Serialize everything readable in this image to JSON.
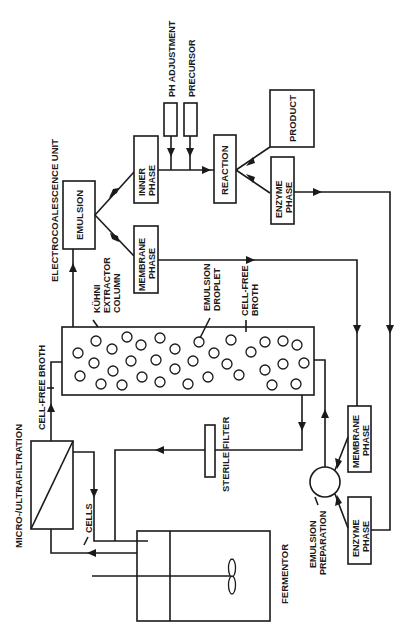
{
  "diagram": {
    "orientation": "rotated-90-ccw",
    "colors": {
      "ink": "#1a1a1a",
      "background": "#ffffff"
    },
    "nodes": {
      "fermentor": {
        "label": "FERMENTOR"
      },
      "filtration": {
        "label": "MICRO-/ULTRAFILTRATION"
      },
      "cells": {
        "label": "CELLS"
      },
      "cell_free_broth_in": {
        "label": "CELL-FREE BROTH"
      },
      "sterile_filter": {
        "label": "STERILE  FILTER"
      },
      "extractor": {
        "line1": "KÜHNI",
        "line2": "EXTRACTOR",
        "line3": "COLUMN"
      },
      "emulsion_droplet": {
        "line1": "EMULSION",
        "line2": "DROPLET"
      },
      "cell_free_broth_out": {
        "line1": "CELL-FREE",
        "line2": "BROTH"
      },
      "electrocoalescence": {
        "label": "ELECTROCOALESCENCE UNIT"
      },
      "emulsion": {
        "label": "EMULSION"
      },
      "inner_phase": {
        "line1": "INNER",
        "line2": "PHASE"
      },
      "membrane_phase_top": {
        "line1": "MEMBRANE",
        "line2": "PHASE"
      },
      "ph_adjustment": {
        "label": "PH ADJUSTMENT"
      },
      "precursor": {
        "label": "PRECURSOR"
      },
      "reaction": {
        "label": "REACTION"
      },
      "product": {
        "label": "PRODUCT"
      },
      "enzyme_phase_top": {
        "line1": "ENZYME",
        "line2": "PHASE"
      },
      "membrane_phase_bottom": {
        "line1": "MEMBRANE",
        "line2": "PHASE"
      },
      "enzyme_phase_bottom": {
        "line1": "ENZYME",
        "line2": "PHASE"
      },
      "emulsion_preparation": {
        "line1": "EMULSION",
        "line2": "PREPARATION"
      }
    },
    "edges": [
      {
        "from": "fermentor",
        "to": "filtration"
      },
      {
        "from": "filtration",
        "to": "fermentor",
        "label": "CELLS"
      },
      {
        "from": "filtration",
        "to": "extractor",
        "label": "CELL-FREE BROTH"
      },
      {
        "from": "extractor",
        "to": "sterile_filter",
        "via": "cell-free broth"
      },
      {
        "from": "sterile_filter",
        "to": "fermentor"
      },
      {
        "from": "extractor",
        "to": "emulsion"
      },
      {
        "from": "emulsion",
        "to": "inner_phase"
      },
      {
        "from": "emulsion",
        "to": "membrane_phase_top"
      },
      {
        "from": "ph_adjustment",
        "to": "reaction_line"
      },
      {
        "from": "precursor",
        "to": "reaction_line"
      },
      {
        "from": "inner_phase",
        "to": "reaction"
      },
      {
        "from": "reaction",
        "to": "product"
      },
      {
        "from": "reaction",
        "to": "enzyme_phase_top"
      },
      {
        "from": "membrane_phase_top",
        "to": "membrane_phase_bottom"
      },
      {
        "from": "enzyme_phase_top",
        "to": "enzyme_phase_bottom"
      },
      {
        "from": "membrane_phase_bottom",
        "to": "emulsion_preparation"
      },
      {
        "from": "enzyme_phase_bottom",
        "to": "emulsion_preparation"
      },
      {
        "from": "emulsion_preparation",
        "to": "extractor"
      }
    ]
  }
}
